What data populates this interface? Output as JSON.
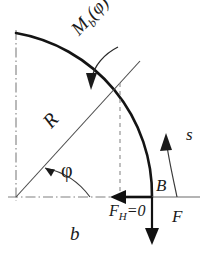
{
  "figure": {
    "caption": "b",
    "colors": {
      "ink": "#1a1a1a",
      "thin_line": "#555555",
      "dash_dot": "#777777",
      "background": "#ffffff"
    },
    "labels": {
      "radius": "R",
      "moment": "M",
      "moment_sub": "b",
      "moment_arg": "(φ)",
      "angle": "φ",
      "point_b": "B",
      "arc_coordinate": "s",
      "force_vertical": "F",
      "force_horizontal": "F",
      "force_horizontal_sub": "H",
      "force_horizontal_value": "=0",
      "caption": "b"
    },
    "geometry": {
      "center_x": 16,
      "center_y": 197,
      "radius": 164,
      "arc_start_deg": 90,
      "arc_end_deg": 24,
      "radius_line_angle_deg": 42
    },
    "elements": [
      "quarter-arc-beam",
      "vertical-axis-dashdot",
      "horizontal-axis-dashdot",
      "radius-line",
      "angle-arc",
      "projection-dashed-line",
      "moment-curved-arrow",
      "s-curved-arrow",
      "horizontal-force-arrow",
      "vertical-force-arrow",
      "support-line"
    ]
  }
}
